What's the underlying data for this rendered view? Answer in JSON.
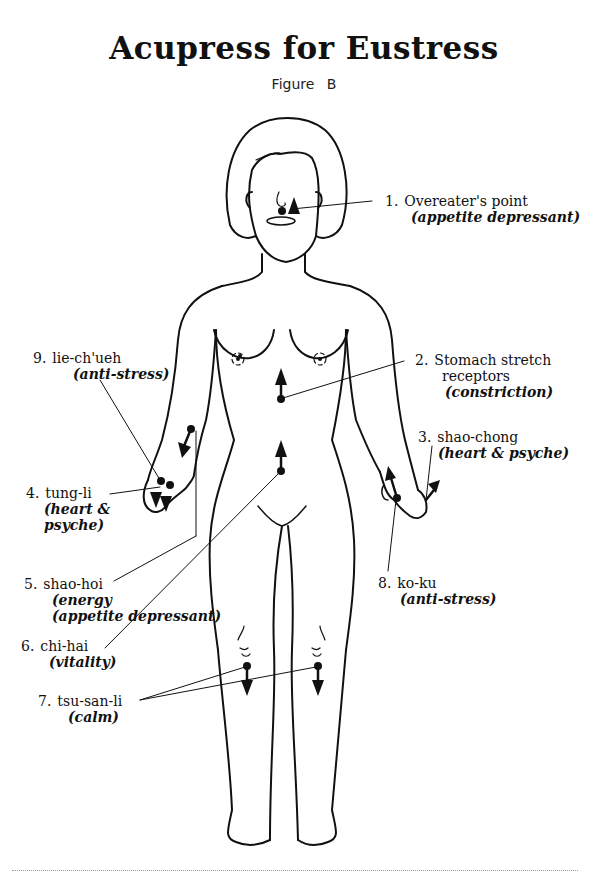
{
  "title": "Acupress for Eustress",
  "subtitle": "Figure B",
  "points": [
    {
      "number": "1.",
      "name": "Overeater's point",
      "desc": "(appetite depressant)"
    },
    {
      "number": "2.",
      "name": "Stomach stretch",
      "name2": "receptors",
      "desc": "(constriction)"
    },
    {
      "number": "3.",
      "name": "shao-chong",
      "desc": "(heart & psyche)"
    },
    {
      "number": "4.",
      "name": "tung-li",
      "desc": "(heart &",
      "desc2": "psyche)"
    },
    {
      "number": "5.",
      "name": "shao-hoi",
      "desc": "(energy",
      "desc2": "(appetite depressant)"
    },
    {
      "number": "6.",
      "name": "chi-hai",
      "desc": "(vitality)"
    },
    {
      "number": "7.",
      "name": "tsu-san-li",
      "desc": "(calm)"
    },
    {
      "number": "8.",
      "name": "ko-ku",
      "desc": "(anti-stress)"
    },
    {
      "number": "9.",
      "name": "lie-ch'ueh",
      "desc": "(anti-stress)"
    }
  ],
  "colors": {
    "ink": "#111111",
    "background": "#ffffff"
  }
}
